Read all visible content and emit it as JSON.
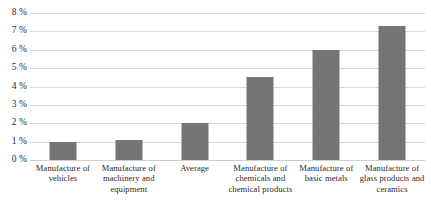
{
  "chart_data": {
    "type": "bar",
    "title": "",
    "xlabel": "",
    "ylabel": "",
    "categories": [
      "Manufacture of vehicles",
      "Manufacture of machinery and equipment",
      "Average",
      "Manufacture of chemicals and chemical products",
      "Manufacture of basic metals",
      "Manufacture of glass products and ceramics"
    ],
    "values": [
      1.0,
      1.1,
      2.0,
      4.5,
      6.0,
      7.3
    ],
    "value_unit": "%",
    "ylim": [
      0,
      8
    ],
    "y_tick_values": [
      8,
      7,
      6,
      5,
      4,
      3,
      2,
      1,
      0
    ],
    "y_tick_labels": [
      "8 %",
      "7 %",
      "6 %",
      "5 %",
      "4 %",
      "3 %",
      "2 %",
      "1 %",
      "0 %"
    ],
    "grid": true,
    "grid_color": "#d9d9d9",
    "legend": null,
    "bar_color": "#757575",
    "background_color": "#ffffff"
  }
}
